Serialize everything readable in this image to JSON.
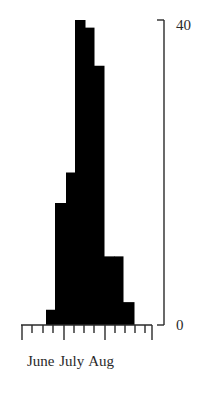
{
  "chart_data": {
    "type": "bar",
    "subtype": "histogram",
    "title": "",
    "xlabel": "",
    "ylabel": "",
    "x_month_labels": [
      "June",
      "July",
      "Aug"
    ],
    "y_tick_labels": [
      "0",
      "40"
    ],
    "ylim": [
      0,
      40
    ],
    "bins": [
      {
        "index": 0,
        "value": 2
      },
      {
        "index": 1,
        "value": 16
      },
      {
        "index": 2,
        "value": 20
      },
      {
        "index": 3,
        "value": 40
      },
      {
        "index": 4,
        "value": 39
      },
      {
        "index": 5,
        "value": 34
      },
      {
        "index": 6,
        "value": 9
      },
      {
        "index": 7,
        "value": 9
      },
      {
        "index": 8,
        "value": 3
      }
    ],
    "values": [
      2,
      16,
      20,
      40,
      39,
      34,
      9,
      9,
      3
    ],
    "bar_color": "#000000",
    "grid": false,
    "legend": null,
    "y_axis_position": "right"
  },
  "axis": {
    "x_label": "June July Aug",
    "y_top_label": "40",
    "y_bottom_label": "0"
  }
}
